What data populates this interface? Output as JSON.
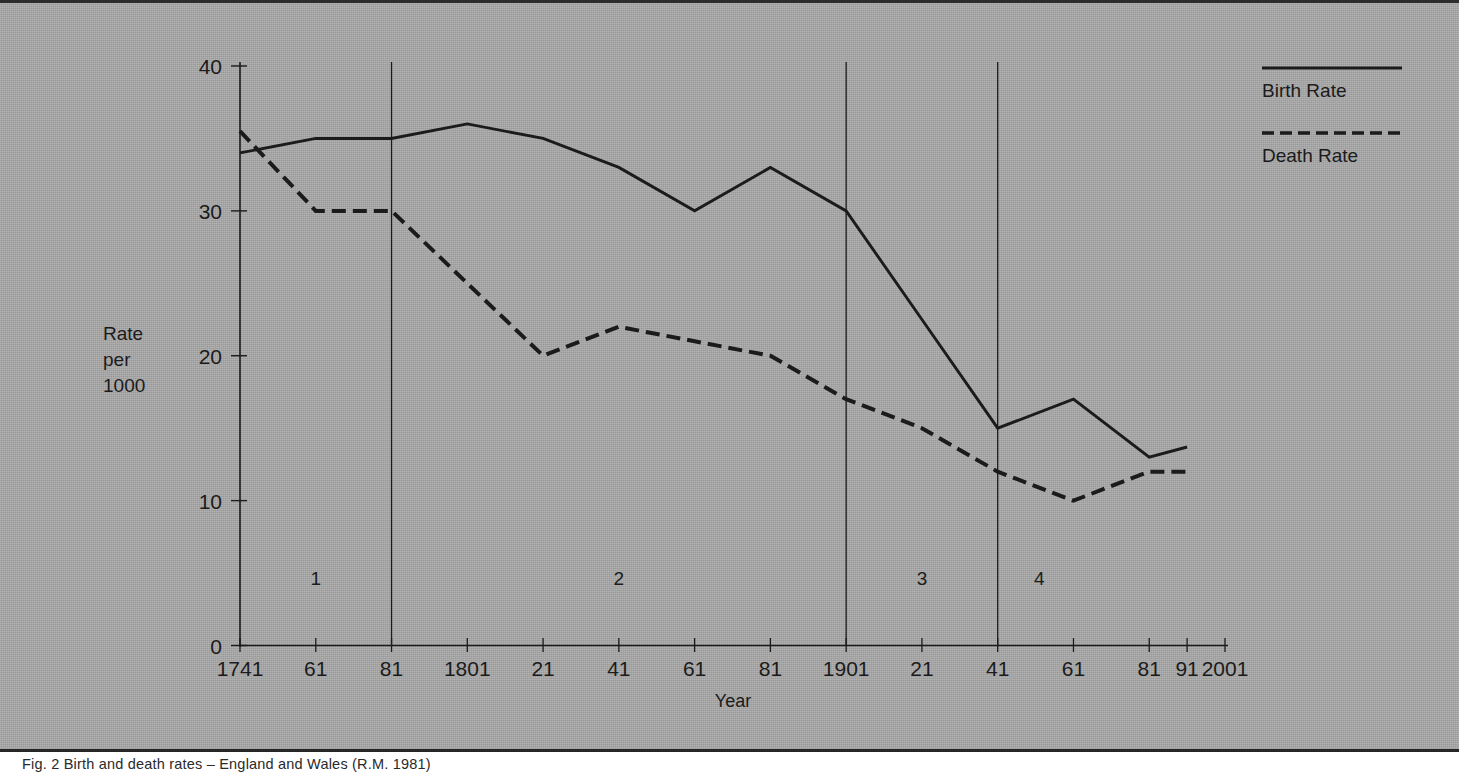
{
  "figure": {
    "caption": "Fig. 2  Birth and death rates – England and Wales (R.M. 1981)",
    "background_color": "#a9a9a9",
    "ink_color": "#1b1b1b"
  },
  "axes": {
    "y_title_lines": [
      "Rate",
      "per",
      "1000"
    ],
    "x_title": "Year",
    "y_ticks": [
      "0",
      "10",
      "20",
      "30",
      "40"
    ],
    "x_tick_labels": [
      "1741",
      "61",
      "81",
      "1801",
      "21",
      "41",
      "61",
      "81",
      "1901",
      "21",
      "41",
      "61",
      "81",
      "91",
      "2001"
    ]
  },
  "legend": {
    "items": [
      {
        "label": "Birth Rate",
        "style": "solid"
      },
      {
        "label": "Death Rate",
        "style": "dashed"
      }
    ]
  },
  "stages": [
    {
      "label": "1"
    },
    {
      "label": "2"
    },
    {
      "label": "3"
    },
    {
      "label": "4"
    }
  ],
  "chart_data": {
    "type": "line",
    "title": "",
    "xlabel": "Year",
    "ylabel": "Rate per 1000",
    "xlim": [
      1741,
      2001
    ],
    "ylim": [
      0,
      40
    ],
    "grid": false,
    "legend_position": "top-right",
    "y_ticks": [
      0,
      10,
      20,
      30,
      40
    ],
    "x_ticks": [
      1741,
      1761,
      1781,
      1801,
      1821,
      1841,
      1861,
      1881,
      1901,
      1921,
      1941,
      1961,
      1981,
      1991,
      2001
    ],
    "x_tick_labels": [
      "1741",
      "61",
      "81",
      "1801",
      "21",
      "41",
      "61",
      "81",
      "1901",
      "21",
      "41",
      "61",
      "81",
      "91",
      "2001"
    ],
    "stage_dividers": [
      1781,
      1901,
      1941
    ],
    "stage_annotations": [
      {
        "label": "1",
        "x": 1761,
        "y": 4.2
      },
      {
        "label": "2",
        "x": 1841,
        "y": 4.2
      },
      {
        "label": "3",
        "x": 1921,
        "y": 4.2
      },
      {
        "label": "4",
        "x": 1952,
        "y": 4.2
      }
    ],
    "series": [
      {
        "name": "Birth Rate",
        "style": "solid",
        "x": [
          1741,
          1761,
          1781,
          1801,
          1821,
          1841,
          1861,
          1881,
          1901,
          1921,
          1941,
          1961,
          1981,
          1991
        ],
        "values": [
          34,
          35,
          35,
          36,
          35,
          33,
          30,
          33,
          30,
          22.5,
          15,
          17,
          13,
          13.7
        ]
      },
      {
        "name": "Death Rate",
        "style": "dashed",
        "x": [
          1741,
          1761,
          1781,
          1801,
          1821,
          1841,
          1861,
          1881,
          1901,
          1921,
          1941,
          1961,
          1981,
          1991
        ],
        "values": [
          35.5,
          30,
          30,
          25,
          20,
          22,
          21,
          20,
          17,
          15,
          12,
          10,
          12,
          12
        ]
      }
    ]
  }
}
